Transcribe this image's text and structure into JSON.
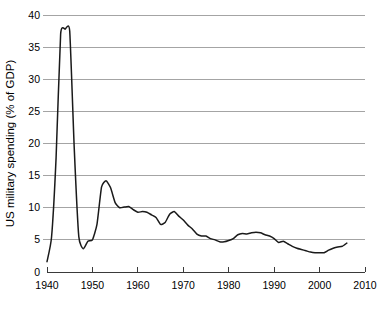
{
  "chart_data": {
    "type": "line",
    "title": "",
    "subtitle": "",
    "xlabel": "",
    "ylabel": "US military spending (% of GDP)",
    "xlim": [
      1940,
      2010
    ],
    "ylim": [
      0,
      40
    ],
    "xticks": [
      1940,
      1950,
      1960,
      1970,
      1980,
      1990,
      2000,
      2010
    ],
    "xtick_labels": [
      "1940",
      "1950",
      "1960",
      "1970",
      "1980",
      "1990",
      "2000",
      "2010"
    ],
    "yticks": [
      0,
      5,
      10,
      15,
      20,
      25,
      30,
      35,
      40
    ],
    "ytick_labels": [
      "0",
      "5",
      "10",
      "15",
      "20",
      "25",
      "30",
      "35",
      "40"
    ],
    "grid": "horizontal",
    "legend": "none",
    "line_color": "#1a1a1a",
    "grid_color": "#9a9a9a",
    "axis_color": "#3a3a3a",
    "background_color": "#ffffff",
    "series": [
      {
        "name": "US military spending (% of GDP)",
        "x": [
          1940,
          1941,
          1942,
          1943,
          1944,
          1945,
          1946,
          1947,
          1948,
          1949,
          1950,
          1951,
          1952,
          1953,
          1954,
          1955,
          1956,
          1957,
          1958,
          1959,
          1960,
          1961,
          1962,
          1963,
          1964,
          1965,
          1966,
          1967,
          1968,
          1969,
          1970,
          1971,
          1972,
          1973,
          1974,
          1975,
          1976,
          1977,
          1978,
          1979,
          1980,
          1981,
          1982,
          1983,
          1984,
          1985,
          1986,
          1987,
          1988,
          1989,
          1990,
          1991,
          1992,
          1993,
          1994,
          1995,
          1996,
          1997,
          1998,
          1999,
          2000,
          2001,
          2002,
          2003,
          2004,
          2005,
          2006
        ],
        "values": [
          1.6,
          5.4,
          17.8,
          37.0,
          37.8,
          37.5,
          19.2,
          5.5,
          3.6,
          4.8,
          5.0,
          7.4,
          13.2,
          14.2,
          13.1,
          10.8,
          10.0,
          10.1,
          10.2,
          9.7,
          9.3,
          9.4,
          9.3,
          8.9,
          8.5,
          7.4,
          7.7,
          9.0,
          9.4,
          8.7,
          8.1,
          7.3,
          6.7,
          5.9,
          5.6,
          5.6,
          5.2,
          5.0,
          4.7,
          4.7,
          4.9,
          5.2,
          5.8,
          6.0,
          5.9,
          6.1,
          6.2,
          6.1,
          5.8,
          5.6,
          5.2,
          4.6,
          4.8,
          4.4,
          4.0,
          3.7,
          3.5,
          3.3,
          3.1,
          3.0,
          3.0,
          3.0,
          3.4,
          3.7,
          3.9,
          4.0,
          4.5
        ],
        "color": "#1a1a1a"
      }
    ]
  }
}
